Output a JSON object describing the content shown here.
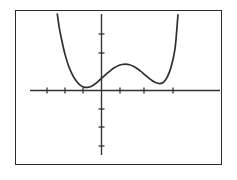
{
  "screen": {
    "title": "Graphing calculator display",
    "background_color": "#ffffff",
    "frame_color": "#2b2b2b",
    "curve_color": "#2e2e2e",
    "axis_color": "#333333"
  },
  "chart_data": {
    "type": "line",
    "title": "",
    "subtitle": "",
    "xlabel": "",
    "ylabel": "",
    "grid": false,
    "legend": "none",
    "xlim": [
      -4,
      5
    ],
    "ylim": [
      -4,
      4
    ],
    "x_tick_labels": [],
    "y_tick_labels": [],
    "x_ticks": [
      -3,
      -2,
      -1,
      1,
      2,
      3
    ],
    "y_ticks": [
      -3,
      -2,
      -1,
      1,
      2
    ],
    "series": [
      {
        "name": "f(x)",
        "x": [
          -2.3,
          -2.2,
          -2.05,
          -1.9,
          -1.7,
          -1.5,
          -1.3,
          -1.1,
          -0.9,
          -0.7,
          -0.5,
          -0.3,
          -0.1,
          0.1,
          0.3,
          0.5,
          0.7,
          0.9,
          1.1,
          1.3,
          1.5,
          1.7,
          1.9,
          2.1,
          2.3,
          2.5,
          2.7,
          2.9,
          3.1,
          3.3,
          3.5,
          3.7,
          3.9,
          4.05
        ],
        "y": [
          4.0,
          3.3,
          2.55,
          1.9,
          1.25,
          0.8,
          0.47,
          0.26,
          0.15,
          0.14,
          0.2,
          0.33,
          0.5,
          0.68,
          0.86,
          1.02,
          1.17,
          1.28,
          1.34,
          1.36,
          1.33,
          1.25,
          1.13,
          0.98,
          0.81,
          0.64,
          0.49,
          0.38,
          0.34,
          0.42,
          0.7,
          1.25,
          2.2,
          3.95
        ]
      }
    ],
    "features": {
      "local_minima": [
        [
          -0.7,
          0.14
        ],
        [
          3.05,
          0.33
        ]
      ],
      "local_maximum": [
        [
          1.3,
          1.36
        ]
      ],
      "y_intercept": [
        0,
        0.59
      ]
    }
  },
  "axes": {
    "x_axis_name": "horizontal axis",
    "y_axis_name": "vertical axis",
    "x_axis_extent_px": [
      30,
      220
    ],
    "y_axis_extent_px": [
      14,
      155
    ],
    "origin_px": [
      101,
      90
    ]
  }
}
